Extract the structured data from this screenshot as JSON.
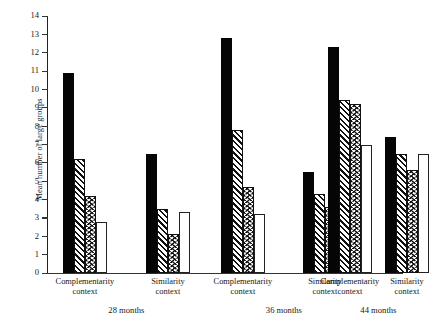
{
  "chart_data": {
    "type": "bar",
    "title": "",
    "subtitle": "",
    "xlabel": "",
    "ylabel": "Mean number of large groups",
    "ylim": [
      0,
      14
    ],
    "yticks": [
      0,
      1,
      2,
      3,
      4,
      5,
      6,
      7,
      8,
      9,
      10,
      11,
      12,
      13,
      14
    ],
    "ytick_labels": [
      "0",
      "1",
      "2",
      "3",
      "4",
      "5",
      "6",
      "7",
      "8",
      "9",
      "10",
      "11",
      "12",
      "13",
      "14"
    ],
    "grid": false,
    "legend": "none",
    "group_labels": [
      "28 months",
      "36 months",
      "44 months"
    ],
    "categories": [
      "Complementarity context",
      "Similarity context",
      "Complementarity context",
      "Similarity context",
      "Complementarity context",
      "Similarity context"
    ],
    "category_lines": [
      [
        "Complementarity",
        "context"
      ],
      [
        "Similarity",
        "context"
      ],
      [
        "Complementarity",
        "context"
      ],
      [
        "Similarity",
        "context"
      ],
      [
        "Complementarity",
        "context"
      ],
      [
        "Similarity",
        "context"
      ]
    ],
    "series": [
      {
        "name": "series-1",
        "fill": "solid-black",
        "values": [
          10.9,
          6.5,
          12.8,
          5.5,
          12.3,
          7.4
        ]
      },
      {
        "name": "series-2",
        "fill": "diagonal-hatch",
        "values": [
          6.2,
          3.5,
          7.8,
          4.3,
          9.4,
          6.5
        ]
      },
      {
        "name": "series-3",
        "fill": "chevron-hatch",
        "values": [
          4.2,
          2.1,
          4.7,
          3.6,
          9.2,
          5.6
        ]
      },
      {
        "name": "series-4",
        "fill": "open-white",
        "values": [
          2.8,
          3.3,
          3.2,
          3.1,
          7.0,
          6.5
        ]
      }
    ],
    "colors": {
      "ink": "#111111",
      "solid": "#050505",
      "open": "#ffffff",
      "axis": "#333333",
      "background": "#ffffff"
    }
  }
}
